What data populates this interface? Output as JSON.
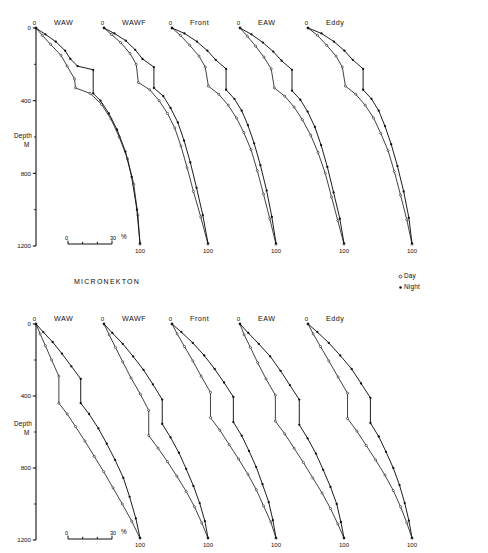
{
  "figure": {
    "section_title": "MICRONEKTON",
    "axis": {
      "y_name_line1": "Depth",
      "y_name_line2": "M",
      "y_ticks": [
        "0",
        "400",
        "800",
        "1200"
      ],
      "y_tick_values": [
        0,
        400,
        800,
        1200
      ],
      "y_minor_values": [
        200,
        600,
        1000
      ],
      "origin_label": "0",
      "end_label": "100"
    },
    "scalebar": {
      "start": "0",
      "end": "30",
      "unit": "%"
    },
    "legend": {
      "day_label": "Day",
      "night_label": "Night",
      "day_marker": "open-circle-icon",
      "night_marker": "filled-dot-icon"
    },
    "colors": {
      "ink": "#111111",
      "background": "#ffffff"
    }
  },
  "chart_data": {
    "type": "line",
    "title": "MICRONEKTON",
    "xlabel": "Cumulative percent (%)",
    "ylabel": "Depth M",
    "ylim": [
      0,
      1200
    ],
    "xlim": [
      0,
      100
    ],
    "grid": false,
    "legend_position": "middle-right",
    "scalebar": {
      "from": 0,
      "to": 30,
      "unit": "%"
    },
    "panels": [
      {
        "row": 1,
        "group": "upper",
        "label": "WAW",
        "series": [
          {
            "name": "Day",
            "marker": "open-circle",
            "x": [
              0,
              6,
              14,
              24,
              30,
              37,
              38,
              52,
              63,
              72,
              80,
              88,
              94,
              98,
              100
            ],
            "y": [
              0,
              40,
              90,
              150,
              210,
              280,
              330,
              360,
              420,
              500,
              600,
              720,
              860,
              1030,
              1190
            ]
          },
          {
            "name": "Night",
            "marker": "filled-dot",
            "x": [
              0,
              9,
              19,
              28,
              33,
              40,
              55,
              55,
              62,
              70,
              78,
              86,
              92,
              97,
              100
            ],
            "y": [
              0,
              35,
              75,
              125,
              170,
              210,
              230,
              360,
              400,
              470,
              560,
              680,
              820,
              1000,
              1185
            ]
          }
        ]
      },
      {
        "row": 1,
        "group": "upper",
        "label": "WAWF",
        "series": [
          {
            "name": "Day",
            "marker": "open-circle",
            "x": [
              0,
              7,
              16,
              25,
              31,
              33,
              44,
              53,
              61,
              68,
              74,
              80,
              86,
              93,
              100
            ],
            "y": [
              0,
              35,
              80,
              140,
              200,
              300,
              340,
              400,
              470,
              550,
              650,
              770,
              900,
              1040,
              1190
            ]
          },
          {
            "name": "Night",
            "marker": "filled-dot",
            "x": [
              0,
              10,
              21,
              30,
              37,
              48,
              48,
              57,
              64,
              71,
              77,
              83,
              89,
              95,
              100
            ],
            "y": [
              0,
              30,
              70,
              120,
              170,
              215,
              330,
              375,
              440,
              520,
              620,
              740,
              880,
              1030,
              1185
            ]
          }
        ]
      },
      {
        "row": 1,
        "group": "upper",
        "label": "Front",
        "series": [
          {
            "name": "Day",
            "marker": "open-circle",
            "x": [
              0,
              8,
              17,
              26,
              32,
              35,
              45,
              54,
              62,
              69,
              76,
              82,
              88,
              94,
              100
            ],
            "y": [
              0,
              40,
              95,
              155,
              215,
              320,
              365,
              425,
              495,
              575,
              670,
              785,
              915,
              1050,
              1190
            ]
          },
          {
            "name": "Night",
            "marker": "filled-dot",
            "x": [
              0,
              12,
              24,
              34,
              42,
              52,
              52,
              60,
              67,
              73,
              79,
              85,
              91,
              96,
              100
            ],
            "y": [
              0,
              30,
              75,
              125,
              175,
              225,
              340,
              390,
              455,
              535,
              635,
              755,
              895,
              1040,
              1185
            ]
          }
        ]
      },
      {
        "row": 1,
        "group": "upper",
        "label": "EAW",
        "series": [
          {
            "name": "Day",
            "marker": "open-circle",
            "x": [
              0,
              7,
              15,
              23,
              30,
              33,
              43,
              52,
              60,
              68,
              75,
              82,
              88,
              94,
              100
            ],
            "y": [
              0,
              45,
              100,
              160,
              225,
              330,
              375,
              435,
              505,
              590,
              685,
              800,
              930,
              1060,
              1190
            ]
          },
          {
            "name": "Night",
            "marker": "filled-dot",
            "x": [
              0,
              11,
              22,
              32,
              40,
              50,
              50,
              58,
              65,
              72,
              78,
              84,
              90,
              96,
              100
            ],
            "y": [
              0,
              35,
              80,
              130,
              180,
              230,
              345,
              395,
              460,
              545,
              645,
              765,
              905,
              1050,
              1185
            ]
          }
        ]
      },
      {
        "row": 1,
        "group": "upper",
        "label": "Eddy",
        "series": [
          {
            "name": "Day",
            "marker": "open-circle",
            "x": [
              0,
              9,
              18,
              27,
              33,
              36,
              46,
              55,
              63,
              70,
              77,
              83,
              89,
              95,
              100
            ],
            "y": [
              0,
              40,
              95,
              155,
              215,
              320,
              365,
              425,
              495,
              580,
              675,
              790,
              920,
              1055,
              1190
            ]
          },
          {
            "name": "Night",
            "marker": "filled-dot",
            "x": [
              0,
              13,
              25,
              35,
              43,
              53,
              53,
              61,
              68,
              74,
              80,
              86,
              92,
              97,
              100
            ],
            "y": [
              0,
              30,
              75,
              125,
              175,
              225,
              340,
              390,
              455,
              540,
              640,
              760,
              900,
              1045,
              1185
            ]
          }
        ]
      },
      {
        "row": 2,
        "group": "lower",
        "label": "WAW",
        "series": [
          {
            "name": "Day",
            "marker": "open-circle",
            "x": [
              0,
              4,
              9,
              15,
              22,
              22,
              30,
              38,
              47,
              56,
              65,
              74,
              83,
              92,
              100
            ],
            "y": [
              0,
              55,
              120,
              200,
              290,
              440,
              500,
              570,
              650,
              735,
              820,
              910,
              1000,
              1095,
              1190
            ]
          },
          {
            "name": "Night",
            "marker": "filled-dot",
            "x": [
              0,
              7,
              16,
              25,
              34,
              43,
              43,
              51,
              60,
              68,
              76,
              84,
              90,
              96,
              100
            ],
            "y": [
              0,
              45,
              100,
              165,
              235,
              305,
              440,
              500,
              580,
              665,
              755,
              855,
              960,
              1080,
              1188
            ]
          }
        ]
      },
      {
        "row": 2,
        "group": "lower",
        "label": "WAWF",
        "series": [
          {
            "name": "Day",
            "marker": "open-circle",
            "x": [
              0,
              5,
              11,
              18,
              26,
              35,
              43,
              43,
              52,
              61,
              70,
              79,
              87,
              94,
              100
            ],
            "y": [
              0,
              60,
              130,
              210,
              300,
              390,
              480,
              620,
              690,
              765,
              845,
              930,
              1015,
              1105,
              1190
            ]
          },
          {
            "name": "Night",
            "marker": "filled-dot",
            "x": [
              0,
              8,
              18,
              28,
              38,
              47,
              56,
              56,
              64,
              72,
              79,
              86,
              92,
              97,
              100
            ],
            "y": [
              0,
              50,
              110,
              180,
              255,
              335,
              420,
              555,
              630,
              715,
              805,
              900,
              995,
              1095,
              1188
            ]
          }
        ]
      },
      {
        "row": 2,
        "group": "lower",
        "label": "Front",
        "series": [
          {
            "name": "Day",
            "marker": "open-circle",
            "x": [
              0,
              5,
              12,
              20,
              28,
              37,
              37,
              46,
              55,
              64,
              73,
              81,
              88,
              95,
              100
            ],
            "y": [
              0,
              55,
              125,
              205,
              290,
              380,
              520,
              590,
              670,
              750,
              835,
              920,
              1010,
              1100,
              1190
            ]
          },
          {
            "name": "Night",
            "marker": "filled-dot",
            "x": [
              0,
              9,
              20,
              31,
              41,
              50,
              59,
              59,
              67,
              74,
              81,
              87,
              93,
              97,
              100
            ],
            "y": [
              0,
              45,
              105,
              175,
              250,
              325,
              405,
              545,
              620,
              705,
              795,
              890,
              990,
              1090,
              1188
            ]
          }
        ]
      },
      {
        "row": 2,
        "group": "lower",
        "label": "EAW",
        "series": [
          {
            "name": "Day",
            "marker": "open-circle",
            "x": [
              0,
              4,
              10,
              17,
              25,
              34,
              34,
              43,
              52,
              61,
              70,
              79,
              87,
              94,
              100
            ],
            "y": [
              0,
              60,
              130,
              215,
              305,
              395,
              540,
              610,
              690,
              770,
              855,
              940,
              1025,
              1110,
              1190
            ]
          },
          {
            "name": "Night",
            "marker": "filled-dot",
            "x": [
              0,
              8,
              18,
              29,
              39,
              48,
              57,
              57,
              65,
              73,
              80,
              87,
              93,
              97,
              100
            ],
            "y": [
              0,
              50,
              110,
              180,
              260,
              340,
              420,
              560,
              635,
              720,
              810,
              905,
              1000,
              1100,
              1188
            ]
          }
        ]
      },
      {
        "row": 2,
        "group": "lower",
        "label": "Eddy",
        "series": [
          {
            "name": "Day",
            "marker": "open-circle",
            "x": [
              0,
              5,
              12,
              20,
              29,
              38,
              38,
              47,
              56,
              65,
              74,
              82,
              89,
              95,
              100
            ],
            "y": [
              0,
              55,
              125,
              205,
              295,
              385,
              525,
              595,
              675,
              755,
              840,
              925,
              1015,
              1105,
              1190
            ]
          },
          {
            "name": "Night",
            "marker": "filled-dot",
            "x": [
              0,
              9,
              20,
              31,
              42,
              51,
              60,
              60,
              68,
              75,
              82,
              88,
              93,
              97,
              100
            ],
            "y": [
              0,
              45,
              105,
              175,
              250,
              330,
              410,
              550,
              625,
              710,
              800,
              895,
              995,
              1092,
              1188
            ]
          }
        ]
      }
    ]
  }
}
